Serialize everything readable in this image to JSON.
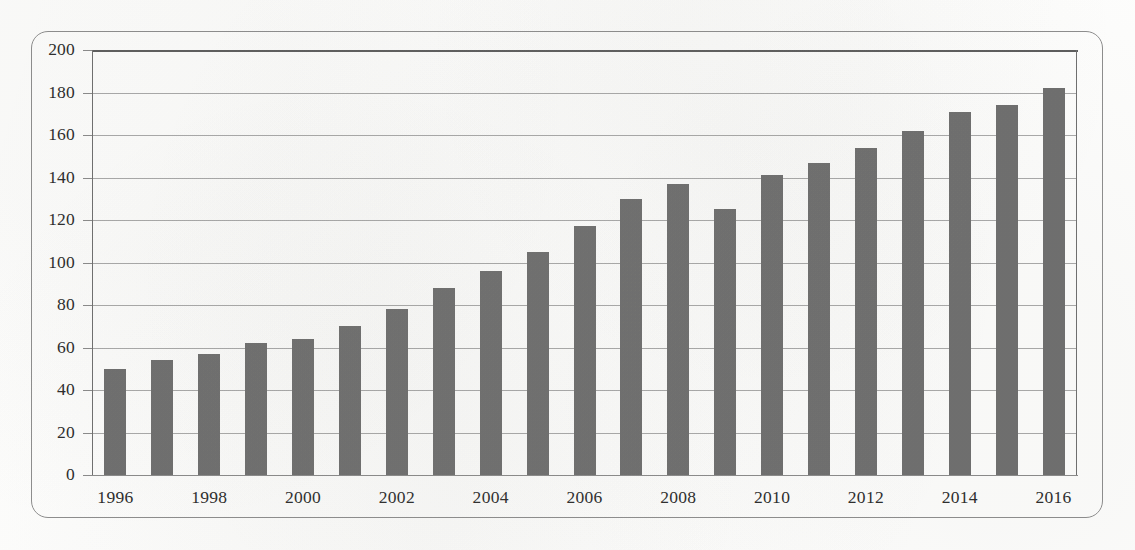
{
  "chart_data": {
    "type": "bar",
    "title": "",
    "subtitle": "",
    "xlabel": "",
    "ylabel": "",
    "categories": [
      "1996",
      "1997",
      "1998",
      "1999",
      "2000",
      "2001",
      "2002",
      "2003",
      "2004",
      "2005",
      "2006",
      "2007",
      "2008",
      "2009",
      "2010",
      "2011",
      "2012",
      "2013",
      "2014",
      "2015",
      "2016"
    ],
    "values": [
      50,
      54,
      57,
      62,
      64,
      70,
      78,
      88,
      96,
      105,
      117,
      130,
      137,
      125,
      141,
      147,
      154,
      162,
      171,
      174,
      182
    ],
    "series": [
      {
        "name": "",
        "values": [
          50,
          54,
          57,
          62,
          64,
          70,
          78,
          88,
          96,
          105,
          117,
          130,
          137,
          125,
          141,
          147,
          154,
          162,
          171,
          174,
          182
        ]
      }
    ],
    "ylim": [
      0,
      200
    ],
    "y_ticks": [
      0,
      20,
      40,
      60,
      80,
      100,
      120,
      140,
      160,
      180,
      200
    ],
    "y_tick_labels": [
      "0",
      "20",
      "40",
      "60",
      "80",
      "100",
      "120",
      "140",
      "160",
      "180",
      "200"
    ],
    "x_tick_labels": [
      "1996",
      "1998",
      "2000",
      "2002",
      "2004",
      "2006",
      "2008",
      "2010",
      "2012",
      "2014",
      "2016"
    ],
    "x_tick_categories": [
      "1996",
      "1998",
      "2000",
      "2002",
      "2004",
      "2006",
      "2008",
      "2010",
      "2012",
      "2014",
      "2016"
    ],
    "grid": true,
    "grid_axis": "y",
    "legend": false,
    "legend_position": "none",
    "annotations": [],
    "bar_color": "#6e6e6e",
    "gridline_color": "#a9a9a9",
    "axis_color": "#6f6f6f",
    "frame_color": "#8d8d8d",
    "background_color": "#fdfdfc",
    "text_color": "#2b2b2b"
  }
}
